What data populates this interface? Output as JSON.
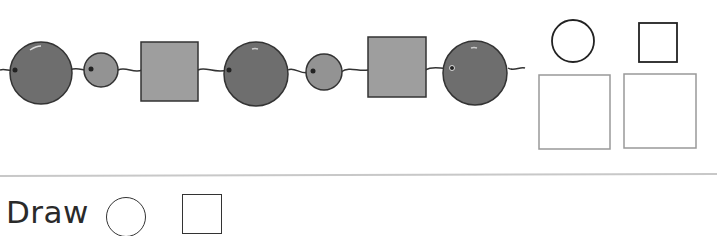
{
  "worksheet": {
    "instruction_label": "Draw",
    "instruction_shapes": [
      "circle",
      "square"
    ],
    "pattern": {
      "sequence": [
        "large-circle",
        "small-circle",
        "square",
        "large-circle",
        "small-circle",
        "square",
        "large-circle"
      ],
      "colors": {
        "large_circle": "#6e6e6e",
        "small_circle": "#939393",
        "square": "#9e9e9e",
        "outline": "#333333",
        "string": "#333333"
      }
    },
    "legend_shapes": [
      "circle",
      "square"
    ],
    "answer_boxes": 2
  }
}
